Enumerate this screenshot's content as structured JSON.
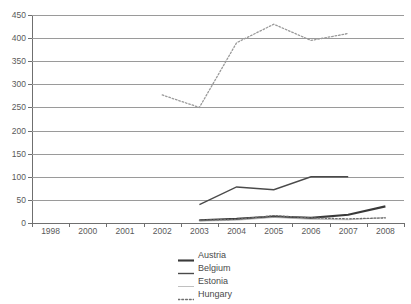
{
  "chart_data": {
    "type": "line",
    "title": "",
    "subtitle": "",
    "xlabel": "",
    "ylabel": "",
    "grid": true,
    "legend_position": "bottom-center",
    "categories": [
      "1998",
      "2000",
      "2001",
      "2002",
      "2003",
      "2004",
      "2005",
      "2006",
      "2007",
      "2008"
    ],
    "x_tick_labels": [
      "1998",
      "2000",
      "2001",
      "2002",
      "2003",
      "2004",
      "2005",
      "2006",
      "2007",
      "2008"
    ],
    "y_tick_labels": [
      "0",
      "50",
      "100",
      "150",
      "200",
      "250",
      "300",
      "350",
      "400",
      "450"
    ],
    "y_ticks": [
      0,
      50,
      100,
      150,
      200,
      250,
      300,
      350,
      400,
      450
    ],
    "ylim": [
      0,
      450
    ],
    "series": [
      {
        "name": "Austria",
        "style": "solid-thick",
        "color": "#3a3a3a",
        "values": [
          null,
          null,
          null,
          null,
          6,
          9,
          14,
          11,
          18,
          36
        ]
      },
      {
        "name": "Belgium",
        "style": "solid-medium",
        "color": "#4a4a4a",
        "values": [
          null,
          null,
          null,
          null,
          40,
          78,
          72,
          100,
          100,
          null
        ]
      },
      {
        "name": "Estonia",
        "style": "solid-thin",
        "color": "#b0b0b0",
        "values": [
          null,
          null,
          null,
          null,
          4,
          6,
          12,
          8,
          7,
          12
        ]
      },
      {
        "name": "Hungary",
        "style": "dotted",
        "color": "#9a9a9a",
        "values": [
          null,
          null,
          null,
          277,
          250,
          390,
          430,
          395,
          410,
          null
        ]
      },
      {
        "name": "Hungary-low",
        "style": "dotted",
        "color": "#6f6f6f",
        "hidden_from_legend": true,
        "values": [
          null,
          null,
          null,
          null,
          6,
          8,
          16,
          11,
          9,
          11
        ]
      }
    ],
    "legend": [
      {
        "label": "Austria",
        "style": "solid-thick",
        "color": "#3a3a3a"
      },
      {
        "label": "Belgium",
        "style": "solid-medium",
        "color": "#4a4a4a"
      },
      {
        "label": "Estonia",
        "style": "solid-thin",
        "color": "#b0b0b0"
      },
      {
        "label": "Hungary",
        "style": "dotted",
        "color": "#6f6f6f"
      }
    ]
  }
}
